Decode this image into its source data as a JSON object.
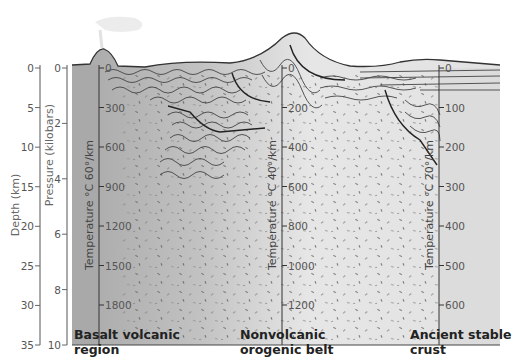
{
  "axes": {
    "depth": {
      "label": "Depth (km)",
      "ticks": [
        "0",
        "5",
        "10",
        "15",
        "20",
        "25",
        "30",
        "35"
      ]
    },
    "pressure": {
      "label": "Pressure (kilobars)",
      "ticks": [
        "0",
        "2",
        "4",
        "6",
        "8",
        "10"
      ]
    }
  },
  "regions": [
    {
      "name": "Basalt volcanic region",
      "line1": "Basalt volcanic",
      "line2": "region",
      "temp_label": "Temperature °C 60°/km",
      "temp_ticks": [
        "0",
        "300",
        "600",
        "900",
        "1200",
        "1500",
        "1800"
      ]
    },
    {
      "name": "Nonvolcanic orogenic belt",
      "line1": "Nonvolcanic",
      "line2": "orogenic belt",
      "temp_label": "Temperature °C 40°/km",
      "temp_ticks": [
        "0",
        "200",
        "400",
        "600",
        "800",
        "1000",
        "1200"
      ]
    },
    {
      "name": "Ancient stable crust",
      "line1": "Ancient stable",
      "line2": "crust",
      "temp_label": "Temperature °C 20°/km",
      "temp_ticks": [
        "0",
        "100",
        "200",
        "300",
        "400",
        "500",
        "600"
      ]
    }
  ],
  "colors": {
    "basalt_column": "#a9a9a9",
    "crust_dark": "#b4b4b4",
    "crust_light": "#e3e3e3",
    "stable_crust": "#dcdcdc",
    "lines": "#333333"
  }
}
